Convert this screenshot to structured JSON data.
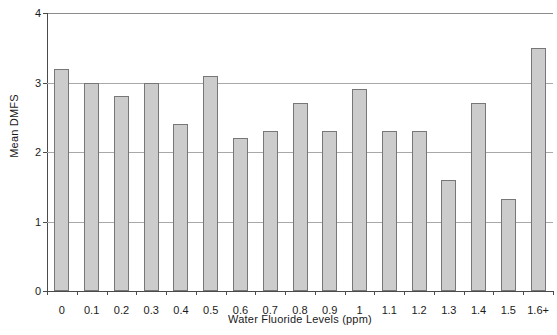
{
  "chart_data": {
    "type": "bar",
    "title": "",
    "xlabel": "Water Fluoride Levels (ppm)",
    "ylabel": "Mean DMFS",
    "categories": [
      "0",
      "0.1",
      "0.2",
      "0.3",
      "0.4",
      "0.5",
      "0.6",
      "0.7",
      "0.8",
      "0.9",
      "1",
      "1.1",
      "1.2",
      "1.3",
      "1.4",
      "1.5",
      "1.6+"
    ],
    "values": [
      3.2,
      3.0,
      2.8,
      3.0,
      2.4,
      3.1,
      2.2,
      2.3,
      2.7,
      2.3,
      2.9,
      2.3,
      2.3,
      1.6,
      2.7,
      1.33,
      3.5
    ],
    "ylim": [
      0,
      4
    ],
    "yticks": [
      0,
      1,
      2,
      3,
      4
    ],
    "ytick_labels": [
      "0",
      "1",
      "2",
      "3",
      "4"
    ],
    "grid": true,
    "grid_axis": "y",
    "legend": null,
    "bar_fill_color": "#cccccc",
    "bar_border_color": "#777777",
    "gridline_color": "#a8a8a8",
    "axis_color": "#4a4a4a",
    "background_color": "#ffffff"
  }
}
